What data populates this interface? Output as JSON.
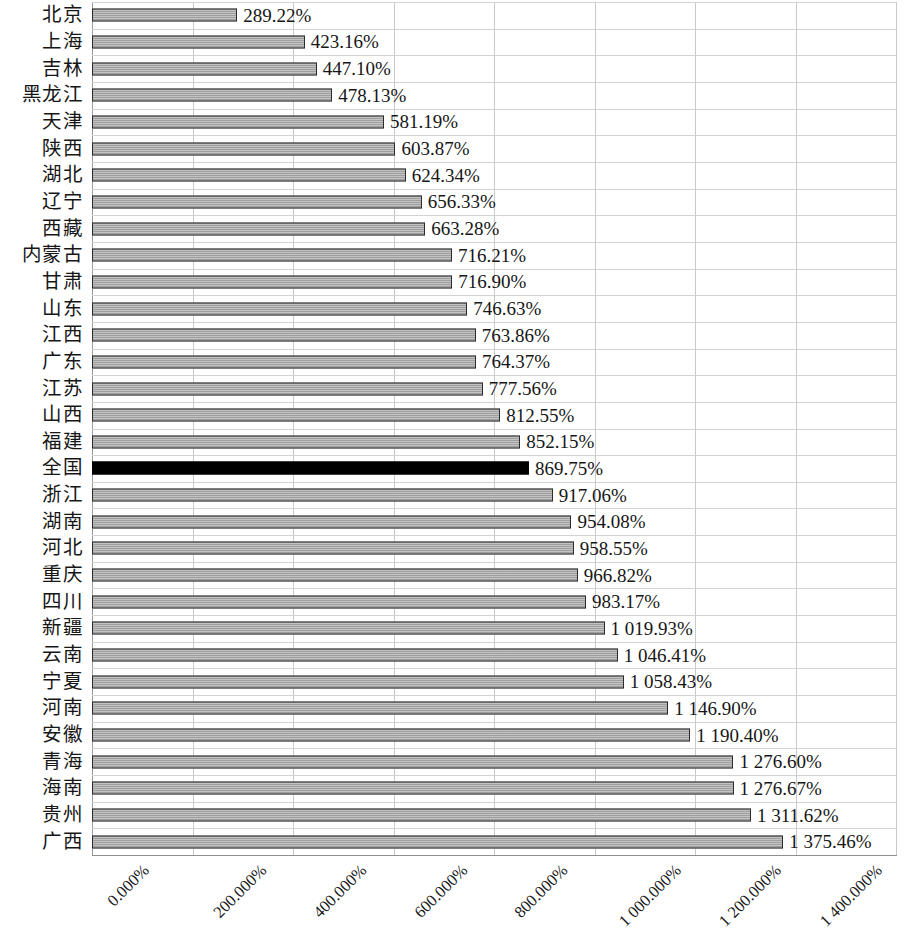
{
  "chart_data": {
    "type": "bar",
    "orientation": "horizontal",
    "title": "",
    "subtitle": "",
    "xlabel": "",
    "ylabel": "",
    "xlim": [
      0,
      1600
    ],
    "x_tick_step": 200,
    "x_tick_labels": [
      "0.000%",
      "200.000%",
      "400.000%",
      "600.000%",
      "800.000%",
      "1 000.000%",
      "1 200.000%",
      "1 400.000%",
      "1 600.000%"
    ],
    "x_tick_values": [
      0,
      200,
      400,
      600,
      800,
      1000,
      1200,
      1400,
      1600
    ],
    "grid": "vertical-and-horizontal",
    "legend": "none",
    "value_unit": "%",
    "thousands_separator": " ",
    "highlight_category": "全国",
    "colors": {
      "bar_fill": "#a9a9a9",
      "bar_border": "#2b2b2b",
      "highlight_fill": "#000000",
      "gridline": "#c9c9c9",
      "text": "#161616",
      "background": "#ffffff"
    },
    "categories": [
      "北京",
      "上海",
      "吉林",
      "黑龙江",
      "天津",
      "陕西",
      "湖北",
      "辽宁",
      "西藏",
      "内蒙古",
      "甘肃",
      "山东",
      "江西",
      "广东",
      "江苏",
      "山西",
      "福建",
      "全国",
      "浙江",
      "湖南",
      "河北",
      "重庆",
      "四川",
      "新疆",
      "云南",
      "宁夏",
      "河南",
      "安徽",
      "青海",
      "海南",
      "贵州",
      "广西"
    ],
    "values": [
      289.22,
      423.16,
      447.1,
      478.13,
      581.19,
      603.87,
      624.34,
      656.33,
      663.28,
      716.21,
      716.9,
      746.63,
      763.86,
      764.37,
      777.56,
      812.55,
      852.15,
      869.75,
      917.06,
      954.08,
      958.55,
      966.82,
      983.17,
      1019.93,
      1046.41,
      1058.43,
      1146.9,
      1190.4,
      1276.6,
      1276.67,
      1311.62,
      1375.46
    ],
    "value_labels": [
      "289.22%",
      "423.16%",
      "447.10%",
      "478.13%",
      "581.19%",
      "603.87%",
      "624.34%",
      "656.33%",
      "663.28%",
      "716.21%",
      "716.90%",
      "746.63%",
      "763.86%",
      "764.37%",
      "777.56%",
      "812.55%",
      "852.15%",
      "869.75%",
      "917.06%",
      "954.08%",
      "958.55%",
      "966.82%",
      "983.17%",
      "1 019.93%",
      "1 046.41%",
      "1 058.43%",
      "1 146.90%",
      "1 190.40%",
      "1 276.60%",
      "1 276.67%",
      "1 311.62%",
      "1 375.46%"
    ]
  }
}
